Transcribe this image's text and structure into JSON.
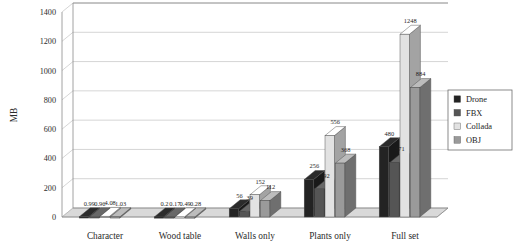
{
  "chart_data": {
    "type": "bar",
    "title": "",
    "xlabel": "",
    "ylabel": "MB",
    "ylim": [
      0,
      1400
    ],
    "yticks": [
      0,
      200,
      400,
      600,
      800,
      1000,
      1200,
      1400
    ],
    "ytick_labels": [
      "0",
      "200",
      "400",
      "600",
      "800",
      "1000",
      "1200",
      "1400"
    ],
    "grid": true,
    "legend_position": "right",
    "style": "3d-grouped-bars-grayscale",
    "categories": [
      "Character",
      "Wood table",
      "Walls only",
      "Plants only",
      "Full set"
    ],
    "series": [
      {
        "name": "Drone",
        "color": "#232323",
        "values": [
          0.99,
          0.2,
          56,
          256,
          480
        ],
        "labels": [
          "0.99",
          "0.2",
          "56",
          "256",
          "480"
        ]
      },
      {
        "name": "FBX",
        "color": "#555555",
        "values": [
          0.96,
          0.17,
          39,
          192,
          371
        ],
        "labels": [
          "0.96",
          "0.17",
          "39",
          "192",
          "371"
        ]
      },
      {
        "name": "Collada",
        "color": "#e2e2e2",
        "values": [
          4.08,
          0.49,
          152,
          556,
          1248
        ],
        "labels": [
          "4.08",
          "0.49",
          "152",
          "556",
          "1248"
        ]
      },
      {
        "name": "OBJ",
        "color": "#9a9a9a",
        "values": [
          1.03,
          0.28,
          112,
          368,
          884
        ],
        "labels": [
          "1.03",
          "0.28",
          "112",
          "368",
          "884"
        ]
      }
    ]
  },
  "legend": {
    "entries": [
      {
        "label": "Drone",
        "swatch": "#232323"
      },
      {
        "label": "FBX",
        "swatch": "#555555"
      },
      {
        "label": "Collada",
        "swatch": "#e2e2e2"
      },
      {
        "label": "OBJ",
        "swatch": "#9a9a9a"
      }
    ]
  }
}
